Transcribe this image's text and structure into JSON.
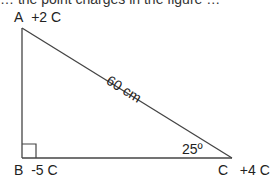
{
  "diagram": {
    "type": "right-triangle",
    "top_clipped_text": "… the point charges in the figure …",
    "vertices": {
      "A": {
        "label": "A",
        "charge": "+2 C",
        "x": 22,
        "y": 28
      },
      "B": {
        "label": "B",
        "charge": "-5 C",
        "x": 22,
        "y": 158
      },
      "C": {
        "label": "C",
        "charge": "+4 C",
        "x": 232,
        "y": 158
      }
    },
    "hypotenuse_label": "60 cm",
    "angle_label": "25º",
    "right_angle_at": "B",
    "colors": {
      "line": "#444444",
      "text": "#222222"
    }
  }
}
